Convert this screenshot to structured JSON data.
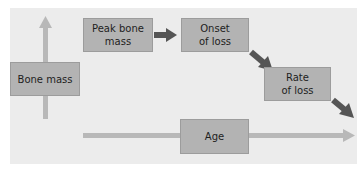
{
  "diagram": {
    "nodes": [
      {
        "id": "bone-mass",
        "label": "Bone mass"
      },
      {
        "id": "peak-bone-mass",
        "label": "Peak bone\nmass"
      },
      {
        "id": "onset-of-loss",
        "label": "Onset\nof loss"
      },
      {
        "id": "rate-of-loss",
        "label": "Rate\nof loss"
      },
      {
        "id": "age",
        "label": "Age"
      }
    ],
    "edges": [
      {
        "from": "peak-bone-mass",
        "to": "onset-of-loss"
      },
      {
        "from": "onset-of-loss",
        "to": "rate-of-loss"
      },
      {
        "from": "rate-of-loss",
        "to": "off-diagram"
      }
    ],
    "axes": {
      "vertical": "Bone mass",
      "horizontal": "Age"
    },
    "colors": {
      "panel": "#ececec",
      "box": "#b3b3b3",
      "axis_arrow": "#b8b8b8",
      "flow_arrow": "#555555"
    }
  }
}
